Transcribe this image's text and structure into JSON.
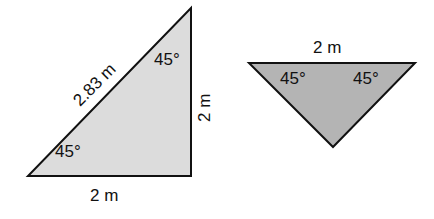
{
  "diagram": {
    "triangles": [
      {
        "id": "right-triangle",
        "fill": "#dcdcdc",
        "stroke": "#111111",
        "labels": {
          "hypotenuse": "2.83 m",
          "vertical_side": "2 m",
          "base": "2 m",
          "top_angle": "45°",
          "bottom_angle": "45°"
        }
      },
      {
        "id": "inverted-triangle",
        "fill": "#b4b4b4",
        "stroke": "#111111",
        "labels": {
          "top_side": "2 m",
          "left_angle": "45°",
          "right_angle": "45°"
        }
      }
    ]
  }
}
